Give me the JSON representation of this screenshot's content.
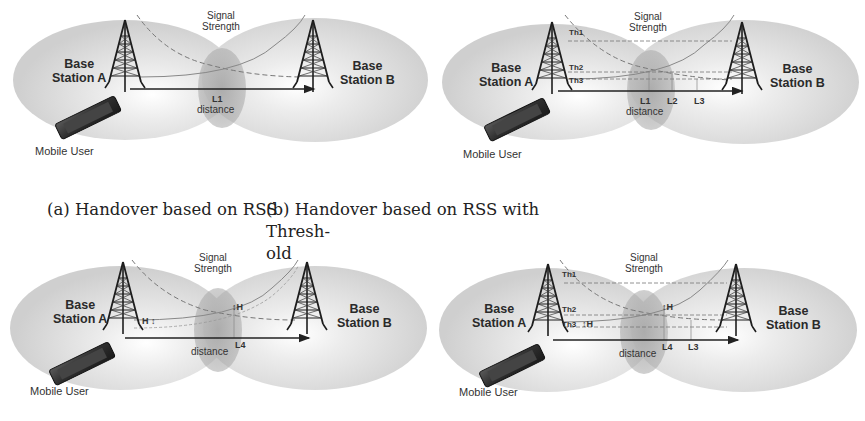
{
  "figure": {
    "panels": [
      {
        "id": "a",
        "caption": "(a) Handover based on RSS",
        "base_station_a": [
          "Base",
          "Station A"
        ],
        "base_station_b": [
          "Base",
          "Station B"
        ],
        "signal_label": [
          "Signal",
          "Strength"
        ],
        "mobile_label": "Mobile User",
        "distance_label": "distance",
        "distance_markers": [
          "L1"
        ],
        "threshold_labels": [],
        "hysteresis_labels": []
      },
      {
        "id": "b",
        "caption": "(b) Handover based on RSS with Thresh-old",
        "caption_lines": [
          "(b) Handover based on RSS with Thresh-",
          "old"
        ],
        "base_station_a": [
          "Base",
          "Station A"
        ],
        "base_station_b": [
          "Base",
          "Station B"
        ],
        "signal_label": [
          "Signal",
          "Strength"
        ],
        "mobile_label": "Mobile User",
        "distance_label": "distance",
        "distance_markers": [
          "L1",
          "L2",
          "L3"
        ],
        "threshold_labels": [
          "Th1",
          "Th2",
          "Th3"
        ],
        "hysteresis_labels": []
      },
      {
        "id": "c",
        "caption": "",
        "base_station_a": [
          "Base",
          "Station A"
        ],
        "base_station_b": [
          "Base",
          "Station B"
        ],
        "signal_label": [
          "Signal",
          "Strength"
        ],
        "mobile_label": "Mobile User",
        "distance_label": "distance",
        "distance_markers": [
          "L4"
        ],
        "threshold_labels": [],
        "hysteresis_labels": [
          "H",
          "H"
        ]
      },
      {
        "id": "d",
        "caption": "",
        "base_station_a": [
          "Base",
          "Station A"
        ],
        "base_station_b": [
          "Base",
          "Station B"
        ],
        "signal_label": [
          "Signal",
          "Strength"
        ],
        "mobile_label": "Mobile User",
        "distance_label": "distance",
        "distance_markers": [
          "L4",
          "L3"
        ],
        "threshold_labels": [
          "Th1",
          "Th2",
          "Th3"
        ],
        "hysteresis_labels": [
          "H",
          "H"
        ]
      }
    ]
  }
}
